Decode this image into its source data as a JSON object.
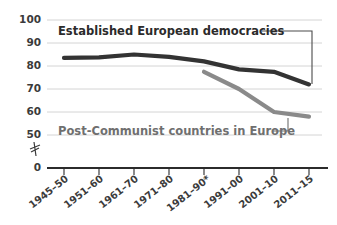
{
  "chart_data": {
    "type": "line",
    "title": "",
    "subtitle": "",
    "xlabel": "",
    "ylabel": "",
    "ylim": [
      50,
      100
    ],
    "y_axis_break": true,
    "y_break_note": "axis broken between 50 and 0",
    "grid": true,
    "legend_position": "inline-callout",
    "x": [
      "1945–50",
      "1951–60",
      "1961–70",
      "1971–80",
      "1981–90*",
      "1991–00",
      "2001–10",
      "2011–15"
    ],
    "yticks": [
      "100",
      "90",
      "80",
      "70",
      "60",
      "50",
      "0"
    ],
    "ytick_values": [
      100,
      90,
      80,
      70,
      60,
      50,
      0
    ],
    "series": [
      {
        "name": "Established European democracies",
        "color": "#333333",
        "values": [
          83.5,
          83.8,
          85.0,
          84.0,
          82.0,
          78.5,
          77.5,
          72.0
        ]
      },
      {
        "name": "Post-Communist countries in Europe",
        "color": "#8a8a8a",
        "values": [
          null,
          null,
          null,
          null,
          77.5,
          70.0,
          60.0,
          58.0
        ]
      }
    ],
    "annotations": [
      {
        "text": "Established European democracies",
        "for_series": "Established European democracies"
      },
      {
        "text": "Post-Communist countries in Europe",
        "for_series": "Post-Communist countries in Europe"
      }
    ],
    "footnote_marker": "*"
  },
  "colors": {
    "series_dark": "#333333",
    "series_gray": "#8a8a8a",
    "gridline": "#c9c9c9",
    "axis": "#2b2b2b",
    "text": "#3b3b3b",
    "background": "#ffffff"
  }
}
